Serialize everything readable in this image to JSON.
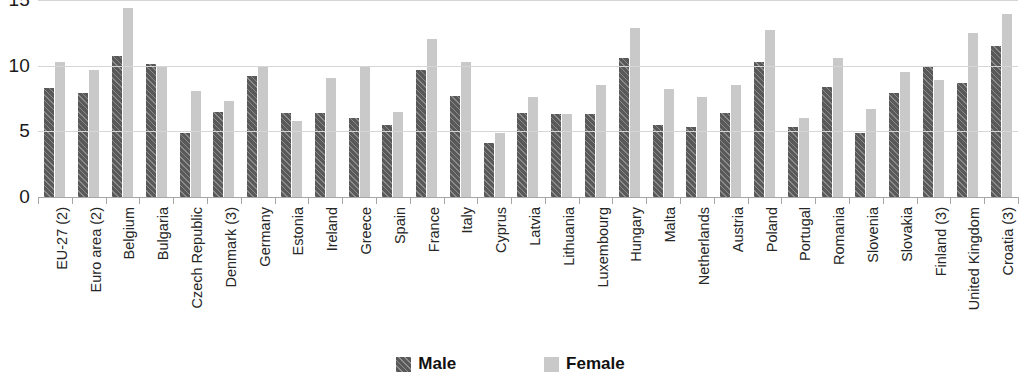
{
  "chart_data": {
    "type": "bar",
    "title": "",
    "xlabel": "",
    "ylabel": "",
    "ylim": [
      0,
      15
    ],
    "yticks": [
      0,
      5,
      10,
      15
    ],
    "grid": true,
    "legend_position": "bottom",
    "categories": [
      "EU-27 (2)",
      "Euro area (2)",
      "Belgium",
      "Bulgaria",
      "Czech Republic",
      "Denmark (3)",
      "Germany",
      "Estonia",
      "Ireland",
      "Greece",
      "Spain",
      "France",
      "Italy",
      "Cyprus",
      "Latvia",
      "Lithuania",
      "Luxembourg",
      "Hungary",
      "Malta",
      "Netherlands",
      "Austria",
      "Poland",
      "Portugal",
      "Romania",
      "Slovenia",
      "Slovakia",
      "Finland (3)",
      "United Kingdom",
      "Croatia (3)"
    ],
    "series": [
      {
        "name": "Male",
        "color": "#595959",
        "values": [
          8.3,
          7.9,
          10.7,
          10.1,
          4.9,
          6.5,
          9.2,
          6.4,
          6.4,
          6.0,
          5.5,
          9.7,
          7.7,
          4.1,
          6.4,
          6.3,
          6.3,
          10.6,
          5.5,
          5.3,
          6.4,
          10.3,
          5.3,
          8.4,
          4.9,
          7.9,
          10.0,
          8.7,
          11.5
        ]
      },
      {
        "name": "Female",
        "color": "#c9c9c9",
        "values": [
          10.3,
          9.7,
          14.4,
          10.0,
          8.1,
          7.3,
          10.0,
          5.8,
          9.1,
          10.0,
          6.5,
          12.0,
          10.3,
          4.9,
          7.6,
          6.3,
          8.5,
          12.9,
          8.2,
          7.6,
          8.5,
          12.7,
          6.0,
          10.6,
          6.7,
          9.5,
          8.9,
          12.5,
          13.9
        ]
      }
    ]
  },
  "y_axis": {
    "tick_labels": [
      "15",
      "10",
      "5",
      "0"
    ]
  },
  "legend": {
    "entries": [
      {
        "label": "Male"
      },
      {
        "label": "Female"
      }
    ]
  }
}
